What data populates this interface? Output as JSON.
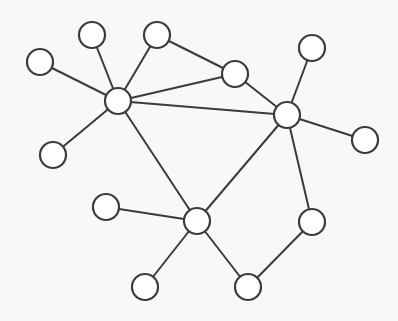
{
  "diagram": {
    "type": "network-graph",
    "style": {
      "background": "#f8f8f7",
      "stroke": "#3b3b3b",
      "node_fill": "#ffffff",
      "node_radius": 13
    },
    "nodes": [
      {
        "id": "A",
        "x": 40,
        "y": 62
      },
      {
        "id": "B",
        "x": 92,
        "y": 35
      },
      {
        "id": "C",
        "x": 157,
        "y": 35
      },
      {
        "id": "H1",
        "x": 118,
        "y": 101
      },
      {
        "id": "D",
        "x": 53,
        "y": 155
      },
      {
        "id": "E",
        "x": 235,
        "y": 74
      },
      {
        "id": "F",
        "x": 312,
        "y": 48
      },
      {
        "id": "H2",
        "x": 287,
        "y": 115
      },
      {
        "id": "G",
        "x": 365,
        "y": 140
      },
      {
        "id": "I",
        "x": 106,
        "y": 207
      },
      {
        "id": "H3",
        "x": 197,
        "y": 221
      },
      {
        "id": "K",
        "x": 312,
        "y": 222
      },
      {
        "id": "J",
        "x": 145,
        "y": 287
      },
      {
        "id": "L",
        "x": 248,
        "y": 287
      }
    ],
    "edges": [
      [
        "A",
        "H1"
      ],
      [
        "B",
        "H1"
      ],
      [
        "C",
        "H1"
      ],
      [
        "D",
        "H1"
      ],
      [
        "H1",
        "E"
      ],
      [
        "H1",
        "H2"
      ],
      [
        "H1",
        "H3"
      ],
      [
        "C",
        "E"
      ],
      [
        "E",
        "H2"
      ],
      [
        "F",
        "H2"
      ],
      [
        "G",
        "H2"
      ],
      [
        "H2",
        "H3"
      ],
      [
        "H2",
        "K"
      ],
      [
        "I",
        "H3"
      ],
      [
        "J",
        "H3"
      ],
      [
        "H3",
        "L"
      ],
      [
        "L",
        "K"
      ]
    ]
  }
}
